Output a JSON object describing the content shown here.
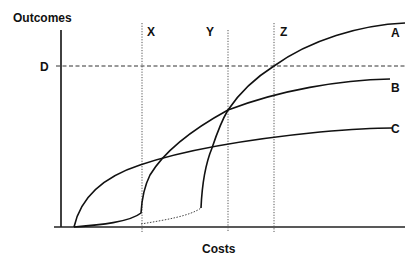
{
  "diagram": {
    "axes": {
      "y_label": "Outcomes",
      "x_label": "Costs"
    },
    "thresholds": {
      "horizontal": {
        "label": "D"
      },
      "vertical": [
        {
          "label": "X"
        },
        {
          "label": "Y"
        },
        {
          "label": "Z"
        }
      ]
    },
    "curves": [
      {
        "label": "A"
      },
      {
        "label": "B"
      },
      {
        "label": "C"
      }
    ],
    "colors": {
      "line": "#111111",
      "guide": "#555555",
      "background": "#ffffff"
    }
  }
}
